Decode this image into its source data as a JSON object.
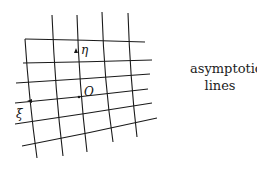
{
  "diagram": {
    "caption_line1": "asymptotic",
    "caption_line2": "lines",
    "labels": {
      "eta": "η",
      "origin": "O",
      "xi": "ξ"
    },
    "line_color": "#1a1a1a"
  }
}
